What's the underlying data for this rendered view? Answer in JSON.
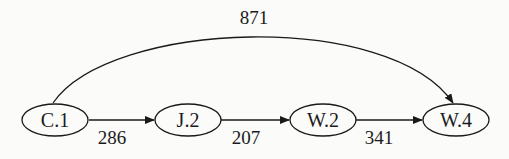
{
  "graph": {
    "type": "directed",
    "nodes": [
      {
        "id": "C.1",
        "label": "C.1",
        "cx": 55,
        "cy": 120
      },
      {
        "id": "J.2",
        "label": "J.2",
        "cx": 188,
        "cy": 120
      },
      {
        "id": "W.2",
        "label": "W.2",
        "cx": 323,
        "cy": 120
      },
      {
        "id": "W.4",
        "label": "W.4",
        "cx": 456,
        "cy": 120
      }
    ],
    "edges": [
      {
        "from": "C.1",
        "to": "J.2",
        "label": "286"
      },
      {
        "from": "J.2",
        "to": "W.2",
        "label": "207"
      },
      {
        "from": "W.2",
        "to": "W.4",
        "label": "341"
      },
      {
        "from": "C.1",
        "to": "W.4",
        "label": "871",
        "curved": true
      }
    ]
  },
  "colors": {
    "stroke": "#1a1a1a",
    "background": "#fbfbfa"
  }
}
